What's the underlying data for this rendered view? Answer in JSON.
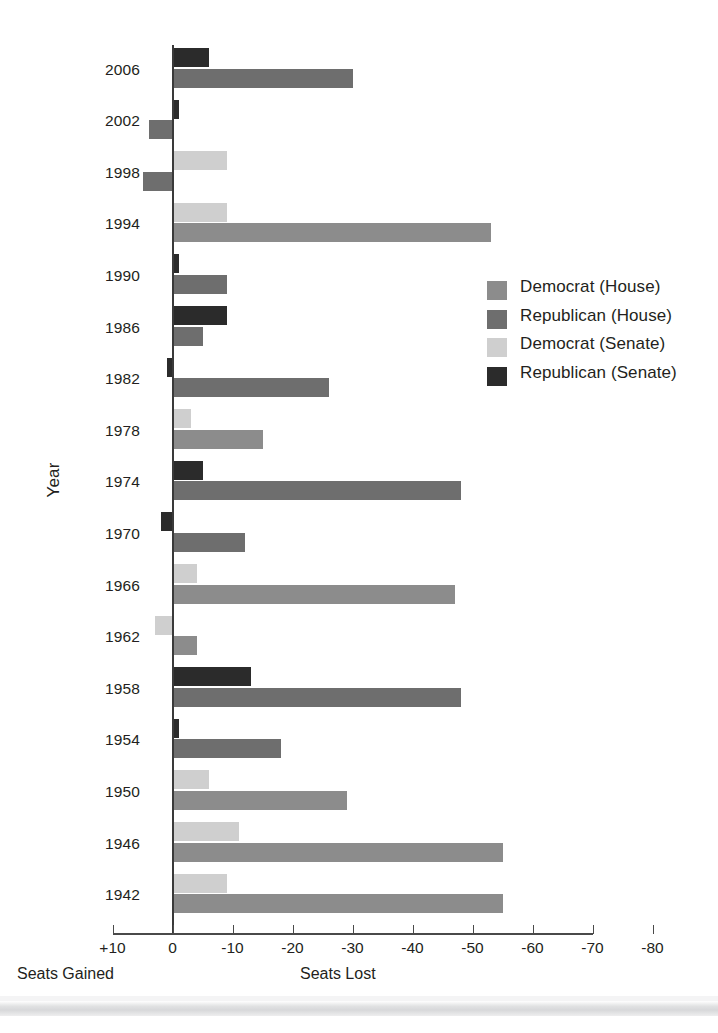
{
  "axes": {
    "ylabel": "Year",
    "x_left_label": "Seats Gained",
    "x_right_label": "Seats Lost",
    "xticks": [
      "+10",
      "0",
      "-10",
      "-20",
      "-30",
      "-40",
      "-50",
      "-60",
      "-70",
      "-80"
    ],
    "xtick_values": [
      10,
      0,
      -10,
      -20,
      -30,
      -40,
      -50,
      -60,
      -70,
      -80
    ]
  },
  "legend": {
    "items": [
      {
        "label": "Democrat (House)",
        "color": "#8c8c8c"
      },
      {
        "label": "Republican (House)",
        "color": "#6e6e6e"
      },
      {
        "label": "Democrat (Senate)",
        "color": "#cfcfcf"
      },
      {
        "label": "Republican (Senate)",
        "color": "#2b2b2b"
      }
    ]
  },
  "chart_data": {
    "type": "bar",
    "orientation": "horizontal",
    "title": "",
    "xlabel": "Seats Lost",
    "ylabel": "Year",
    "xlim": [
      10,
      -80
    ],
    "grid": false,
    "legend_position": "right",
    "note": "Negative values = seats lost by the president's party; positive = seats gained.",
    "categories": [
      2006,
      2002,
      1998,
      1994,
      1990,
      1986,
      1982,
      1978,
      1974,
      1970,
      1966,
      1962,
      1958,
      1954,
      1950,
      1946,
      1942
    ],
    "series": [
      {
        "name": "Democrat (House)",
        "color": "#8c8c8c",
        "values": [
          null,
          null,
          null,
          -53,
          null,
          null,
          null,
          -15,
          null,
          null,
          -47,
          -4,
          null,
          null,
          -29,
          -55,
          -55
        ]
      },
      {
        "name": "Republican (House)",
        "color": "#6e6e6e",
        "values": [
          -30,
          4,
          5,
          null,
          -9,
          -5,
          -26,
          null,
          -48,
          -12,
          null,
          null,
          -48,
          -18,
          null,
          null,
          null
        ]
      },
      {
        "name": "Democrat (Senate)",
        "color": "#cfcfcf",
        "values": [
          null,
          null,
          -9,
          -9,
          null,
          null,
          null,
          -3,
          null,
          null,
          -4,
          3,
          null,
          null,
          -6,
          -11,
          -9
        ]
      },
      {
        "name": "Republican (Senate)",
        "color": "#2b2b2b",
        "values": [
          -6,
          -1,
          null,
          null,
          -1,
          -9,
          1,
          null,
          -5,
          2,
          null,
          null,
          -13,
          -1,
          null,
          null,
          null
        ]
      }
    ]
  }
}
